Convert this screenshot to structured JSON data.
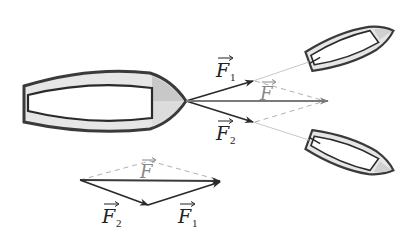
{
  "diagram": {
    "labels": {
      "f1_top": "F",
      "f1_top_sub": "1",
      "f2_top": "F",
      "f2_top_sub": "2",
      "f_top": "F",
      "f_bottom": "F",
      "f1_bottom": "F",
      "f1_bottom_sub": "1",
      "f2_bottom": "F",
      "f2_bottom_sub": "2"
    },
    "colors": {
      "hull_outline": "#3a3a3a",
      "hull_fill": "#e6e6e6",
      "bow_shade": "#c8c8c8",
      "vector_dark": "#2a2a2a",
      "resultant_gray": "#7a7a7a",
      "dashed": "#b0b0b0",
      "tow_line": "#c8c8c8"
    },
    "elements": [
      "large boat (towed)",
      "upper tugboat",
      "lower tugboat",
      "force vector F1",
      "force vector F2",
      "resultant force F",
      "parallelogram dashed lines",
      "vector triangle (F2 + F1 = F)"
    ]
  }
}
